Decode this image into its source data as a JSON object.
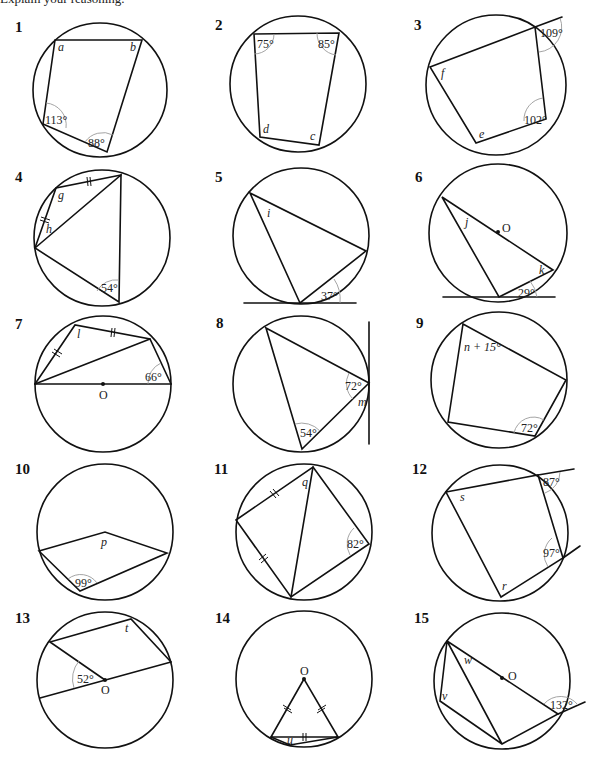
{
  "page": {
    "caption": "Explain your reasoning."
  },
  "diagrams": [
    {
      "number": "1",
      "labels": [
        "a",
        "b"
      ],
      "angles": [
        "113°",
        "88°"
      ]
    },
    {
      "number": "2",
      "labels": [
        "d",
        "c"
      ],
      "angles": [
        "75°",
        "85°"
      ]
    },
    {
      "number": "3",
      "labels": [
        "f",
        "e"
      ],
      "angles": [
        "109°",
        "102°"
      ]
    },
    {
      "number": "4",
      "labels": [
        "g",
        "h"
      ],
      "angles": [
        "54°"
      ]
    },
    {
      "number": "5",
      "labels": [
        "i"
      ],
      "angles": [
        "37°"
      ]
    },
    {
      "number": "6",
      "labels": [
        "j",
        "k",
        "O"
      ],
      "angles": [
        "29°"
      ]
    },
    {
      "number": "7",
      "labels": [
        "l",
        "O"
      ],
      "angles": [
        "66°"
      ]
    },
    {
      "number": "8",
      "labels": [
        "m"
      ],
      "angles": [
        "72°",
        "54°"
      ]
    },
    {
      "number": "9",
      "labels": [
        "n + 15°"
      ],
      "angles": [
        "72°"
      ]
    },
    {
      "number": "10",
      "labels": [
        "p"
      ],
      "angles": [
        "99°"
      ]
    },
    {
      "number": "11",
      "labels": [
        "q"
      ],
      "angles": [
        "82°"
      ]
    },
    {
      "number": "12",
      "labels": [
        "s",
        "r"
      ],
      "angles": [
        "87°",
        "97°"
      ]
    },
    {
      "number": "13",
      "labels": [
        "t",
        "O"
      ],
      "angles": [
        "52°"
      ]
    },
    {
      "number": "14",
      "labels": [
        "O",
        "u"
      ],
      "angles": []
    },
    {
      "number": "15",
      "labels": [
        "w",
        "O",
        "v"
      ],
      "angles": [
        "132°"
      ]
    }
  ]
}
